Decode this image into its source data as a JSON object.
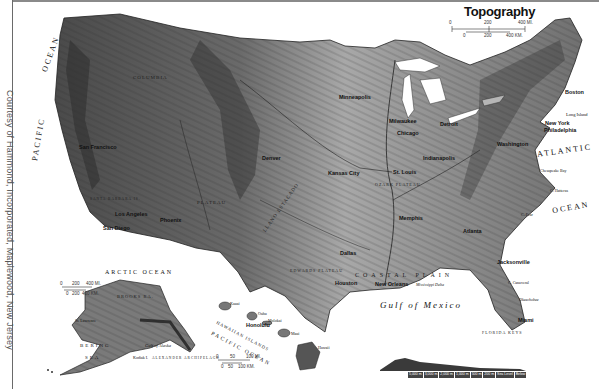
{
  "map": {
    "title": "Topography",
    "credit": "Courtesy of Hammond, Incorporated, Maplewood, New Jersey",
    "colors": {
      "land_dark": "#3a3a3a",
      "land_mid": "#8c8c8c",
      "land_light": "#c8c8c8",
      "water": "#ffffff",
      "frame": "#8a8a8a"
    },
    "main_scale": {
      "miles": [
        "0",
        "200",
        "400 MI."
      ],
      "km": [
        "0",
        "200",
        "400 KM."
      ]
    },
    "alaska_scale": {
      "miles": [
        "0",
        "200",
        "400 MI."
      ],
      "km": [
        "0",
        "200",
        "400 KM."
      ]
    },
    "hawaii_scale": {
      "miles": [
        "0",
        "50",
        "100 MI."
      ],
      "km": [
        "0",
        "50",
        "100 KM."
      ]
    },
    "oceans": {
      "pacific": "PACIFIC",
      "pacific_ocean": "OCEAN",
      "atlantic": "ATLANTIC",
      "atlantic_ocean": "OCEAN",
      "gulf": "Gulf of Mexico",
      "arctic": "ARCTIC OCEAN",
      "bering": "BERING",
      "bering_sea": "SEA",
      "pacific_hawaii": "PACIFIC OCEAN",
      "gulf_alaska": "Gulf of Alaska"
    },
    "cities": [
      {
        "name": "San Francisco",
        "x": 79,
        "y": 144
      },
      {
        "name": "Los Angeles",
        "x": 115,
        "y": 211
      },
      {
        "name": "San Diego",
        "x": 103,
        "y": 225
      },
      {
        "name": "Phoenix",
        "x": 160,
        "y": 217
      },
      {
        "name": "Denver",
        "x": 262,
        "y": 155
      },
      {
        "name": "Minneapolis",
        "x": 339,
        "y": 94
      },
      {
        "name": "Milwaukee",
        "x": 389,
        "y": 118
      },
      {
        "name": "Chicago",
        "x": 397,
        "y": 130
      },
      {
        "name": "Detroit",
        "x": 440,
        "y": 121
      },
      {
        "name": "Kansas City",
        "x": 328,
        "y": 170
      },
      {
        "name": "St. Louis",
        "x": 393,
        "y": 169
      },
      {
        "name": "Indianapolis",
        "x": 423,
        "y": 155
      },
      {
        "name": "Memphis",
        "x": 399,
        "y": 215
      },
      {
        "name": "Dallas",
        "x": 340,
        "y": 250
      },
      {
        "name": "Houston",
        "x": 335,
        "y": 280
      },
      {
        "name": "New Orleans",
        "x": 375,
        "y": 281
      },
      {
        "name": "Atlanta",
        "x": 463,
        "y": 228
      },
      {
        "name": "Jacksonville",
        "x": 497,
        "y": 259
      },
      {
        "name": "Miami",
        "x": 518,
        "y": 317
      },
      {
        "name": "Washington",
        "x": 497,
        "y": 141
      },
      {
        "name": "Philadelphia",
        "x": 544,
        "y": 127
      },
      {
        "name": "New York",
        "x": 545,
        "y": 120
      },
      {
        "name": "Boston",
        "x": 565,
        "y": 89
      },
      {
        "name": "Honolulu",
        "x": 246,
        "y": 322
      }
    ],
    "features": [
      {
        "name": "COLUMBIA",
        "x": 133,
        "y": 75
      },
      {
        "name": "PLATEAU",
        "x": 197,
        "y": 200
      },
      {
        "name": "LLANO ESTACADO",
        "x": 266,
        "y": 227
      },
      {
        "name": "EDWARDS PLATEAU",
        "x": 290,
        "y": 268
      },
      {
        "name": "OZARK PLATEAU",
        "x": 380,
        "y": 182
      },
      {
        "name": "COASTAL PLAIN",
        "x": 365,
        "y": 277
      },
      {
        "name": "Mississippi Delta",
        "x": 415,
        "y": 284
      },
      {
        "name": "Long Island",
        "x": 570,
        "y": 113
      },
      {
        "name": "Chesapeake Bay",
        "x": 540,
        "y": 170
      },
      {
        "name": "C. Hatteras",
        "x": 550,
        "y": 190
      },
      {
        "name": "C. Fear",
        "x": 520,
        "y": 213
      },
      {
        "name": "C. Canaveral",
        "x": 508,
        "y": 282
      },
      {
        "name": "Okeechobee",
        "x": 520,
        "y": 298
      },
      {
        "name": "FLORIDA KEYS",
        "x": 482,
        "y": 330
      },
      {
        "name": "SANTA BARBARA IS.",
        "x": 94,
        "y": 200
      },
      {
        "name": "St. Lawrence",
        "x": 75,
        "y": 318
      },
      {
        "name": "BROOKS RA.",
        "x": 120,
        "y": 295
      },
      {
        "name": "Kodiak I.",
        "x": 133,
        "y": 355
      },
      {
        "name": "ALEXANDER ARCHIPELAGO",
        "x": 160,
        "y": 356
      },
      {
        "name": "HAWAIIAN ISLANDS",
        "x": 240,
        "y": 328
      },
      {
        "name": "Kauai",
        "x": 228,
        "y": 303
      },
      {
        "name": "Oahu",
        "x": 258,
        "y": 314
      },
      {
        "name": "Molokai",
        "x": 270,
        "y": 322
      },
      {
        "name": "Maui",
        "x": 292,
        "y": 332
      },
      {
        "name": "Hawaii",
        "x": 315,
        "y": 345
      }
    ],
    "elevation_legend": {
      "cells": [
        "5,000 m",
        "3,000 m",
        "2,000 m",
        "1,000 m",
        "500 m",
        "200 m",
        "Sea Level",
        "Below"
      ]
    }
  }
}
